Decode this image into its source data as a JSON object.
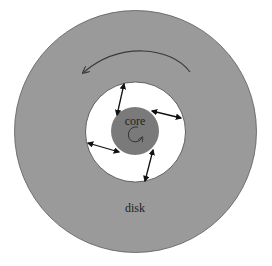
{
  "diagram": {
    "type": "accretion-disk-schematic",
    "labels": {
      "core": "core",
      "disk": "disk"
    },
    "colors": {
      "disk_fill": "#9a9a9a",
      "disk_stroke": "#5a5a5a",
      "hole_fill": "#ffffff",
      "core_fill": "#7a7a7a",
      "arrow": "#111111",
      "rotation_arrow": "#3a3a3a"
    },
    "geometry": {
      "center": [
        135.5,
        131.5
      ],
      "disk_radius": 121,
      "hole_radius": 50,
      "core_radius": 24
    },
    "rotation": {
      "disk": "counter-clockwise",
      "core": "clockwise-spiral"
    },
    "field_lines": [
      {
        "from": [
          124,
          84
        ],
        "to": [
          117,
          115
        ]
      },
      {
        "from": [
          152,
          111
        ],
        "to": [
          181,
          118
        ]
      },
      {
        "from": [
          88,
          143
        ],
        "to": [
          119,
          152
        ]
      },
      {
        "from": [
          153,
          150
        ],
        "to": [
          145,
          181
        ]
      }
    ]
  }
}
